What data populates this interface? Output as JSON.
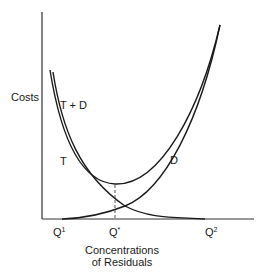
{
  "diagram": {
    "y_axis_label": "Costs",
    "x_axis_label_line1": "Concentrations",
    "x_axis_label_line2": "of Residuals",
    "curves": {
      "total": "T + D",
      "treatment": "T",
      "damage": "D"
    },
    "x_ticks": {
      "q1_base": "Q",
      "q1_sup": "1",
      "qstar_base": "Q",
      "qstar_sup": "*",
      "q2_base": "Q",
      "q2_sup": "2"
    },
    "colors": {
      "line": "#1a1a1a",
      "axis": "#333333",
      "background": "#ffffff"
    }
  }
}
